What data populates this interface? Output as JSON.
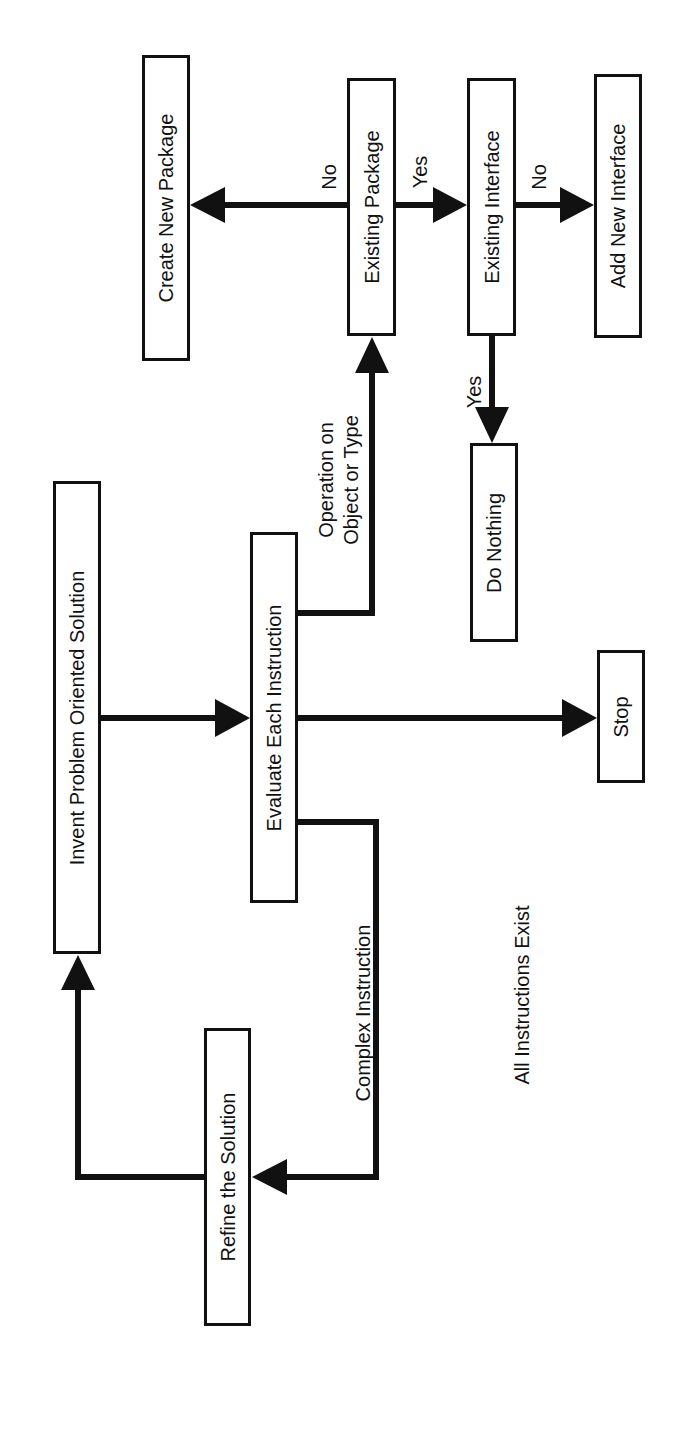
{
  "diagram": {
    "type": "flowchart",
    "orientation": "rotated-90-ccw",
    "colors": {
      "stroke": "#111111",
      "background": "#ffffff",
      "text": "#111111"
    },
    "nodes": [
      {
        "id": "invent",
        "label": "Invent Problem Oriented Solution",
        "x": 53,
        "y": 481,
        "w": 48,
        "h": 473
      },
      {
        "id": "evaluate",
        "label": "Evaluate Each Instruction",
        "x": 250,
        "y": 532,
        "w": 48,
        "h": 371
      },
      {
        "id": "refine",
        "label": "Refine the Solution",
        "x": 204,
        "y": 1028,
        "w": 47,
        "h": 298
      },
      {
        "id": "create_package",
        "label": "Create New Package",
        "x": 142,
        "y": 55,
        "w": 48,
        "h": 306
      },
      {
        "id": "existing_package",
        "label": "Existing Package",
        "x": 347,
        "y": 78,
        "w": 49,
        "h": 258
      },
      {
        "id": "existing_interface",
        "label": "Existing Interface",
        "x": 467,
        "y": 78,
        "w": 49,
        "h": 258
      },
      {
        "id": "add_interface",
        "label": "Add New Interface",
        "x": 594,
        "y": 74,
        "w": 48,
        "h": 264
      },
      {
        "id": "do_nothing",
        "label": "Do Nothing",
        "x": 470,
        "y": 443,
        "w": 48,
        "h": 199
      },
      {
        "id": "stop",
        "label": "Stop",
        "x": 597,
        "y": 650,
        "w": 48,
        "h": 133
      }
    ],
    "edges": [
      {
        "from": "invent",
        "to": "evaluate",
        "label": ""
      },
      {
        "from": "evaluate",
        "to": "stop",
        "label": ""
      },
      {
        "from": "evaluate",
        "to": "existing_package",
        "label": "Operation on\nObject or Type"
      },
      {
        "from": "evaluate",
        "to": "refine",
        "label": "Complex Instruction"
      },
      {
        "from": "refine",
        "to": "invent",
        "label": ""
      },
      {
        "from": "existing_package",
        "to": "create_package",
        "label": "No"
      },
      {
        "from": "existing_package",
        "to": "existing_interface",
        "label": "Yes"
      },
      {
        "from": "existing_interface",
        "to": "add_interface",
        "label": "No"
      },
      {
        "from": "existing_interface",
        "to": "do_nothing",
        "label": "Yes"
      }
    ],
    "edge_labels": {
      "pkg_no": {
        "text": "No",
        "cx": 329,
        "cy": 177
      },
      "pkg_yes": {
        "text": "Yes",
        "cx": 420,
        "cy": 172
      },
      "iface_no": {
        "text": "No",
        "cx": 539,
        "cy": 177
      },
      "iface_yes": {
        "text": "Yes",
        "cx": 474,
        "cy": 392
      },
      "operation": {
        "text": "Operation on\nObject or Type",
        "cx": 339,
        "cy": 480
      },
      "complex": {
        "text": "Complex Instruction",
        "cx": 363,
        "cy": 1013
      },
      "all_exist": {
        "text": "All Instructions Exist",
        "cx": 522,
        "cy": 995
      }
    }
  }
}
